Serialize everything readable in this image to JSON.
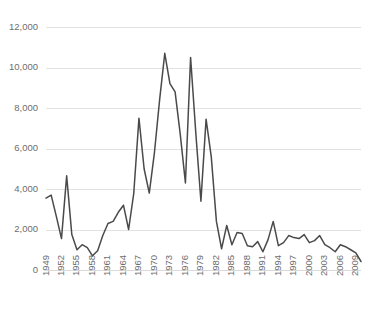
{
  "chart_data": {
    "type": "line",
    "title": "",
    "subtitle": "",
    "xlabel": "",
    "ylabel": "",
    "xlim": [
      1949,
      2010
    ],
    "ylim": [
      0,
      12000
    ],
    "grid": "horizontal",
    "legend": "none",
    "y_ticks": [
      0,
      2000,
      4000,
      6000,
      8000,
      10000,
      12000
    ],
    "y_tick_labels": [
      "0",
      "2,000",
      "4,000",
      "6,000",
      "8,000",
      "10,000",
      "12,000"
    ],
    "x_tick_labels": [
      "1949",
      "1952",
      "1955",
      "1958",
      "1961",
      "1964",
      "1967",
      "1970",
      "1973",
      "1976",
      "1979",
      "1982",
      "1985",
      "1988",
      "1991",
      "1994",
      "1997",
      "2000",
      "2003",
      "2006",
      "2009"
    ],
    "x_tick_step": 3,
    "series": [
      {
        "name": "series-1",
        "color": "#4a4a4a",
        "x": [
          1949,
          1950,
          1951,
          1952,
          1953,
          1954,
          1955,
          1956,
          1957,
          1958,
          1959,
          1960,
          1961,
          1962,
          1963,
          1964,
          1965,
          1966,
          1967,
          1968,
          1969,
          1970,
          1971,
          1972,
          1973,
          1974,
          1975,
          1976,
          1977,
          1978,
          1979,
          1980,
          1981,
          1982,
          1983,
          1984,
          1985,
          1986,
          1987,
          1988,
          1989,
          1990,
          1991,
          1992,
          1993,
          1994,
          1995,
          1996,
          1997,
          1998,
          1999,
          2000,
          2001,
          2002,
          2003,
          2004,
          2005,
          2006,
          2007,
          2008,
          2009,
          2010
        ],
        "values": [
          3550,
          3700,
          2650,
          1550,
          4650,
          1750,
          1000,
          1250,
          1100,
          700,
          950,
          1700,
          2300,
          2400,
          2850,
          3200,
          2000,
          3800,
          7500,
          5000,
          3800,
          5800,
          8400,
          10700,
          9200,
          8800,
          6700,
          4300,
          10500,
          6800,
          3400,
          7450,
          5600,
          2400,
          1050,
          2200,
          1250,
          1850,
          1800,
          1200,
          1150,
          1400,
          900,
          1500,
          2400,
          1200,
          1350,
          1700,
          1600,
          1550,
          1750,
          1350,
          1450,
          1700,
          1250,
          1100,
          900,
          1250,
          1150,
          1000,
          850,
          420
        ]
      }
    ]
  },
  "axes": {
    "y_axis_name": "value-axis",
    "x_axis_name": "year-axis"
  }
}
